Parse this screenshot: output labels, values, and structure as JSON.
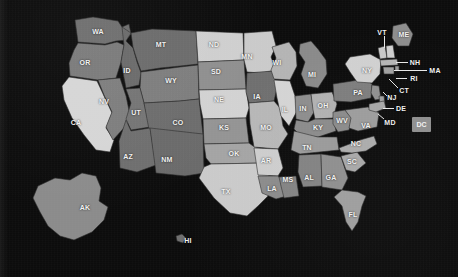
{
  "view": {
    "title": "United States choropleth map",
    "background_color": "#0c0c0c",
    "label_color": "#f2f2f2",
    "leader_line_color": "#e8e8e8",
    "projection": "albers-usa",
    "width": 458,
    "height": 277
  },
  "legend_scale": {
    "type": "sequential-gray",
    "low_color": "#4a4a4a",
    "high_color": "#e2e2e2"
  },
  "states": [
    {
      "code": "WA",
      "name": "Washington",
      "x": 98,
      "y": 31,
      "fill": "#6e6e6e",
      "leader": null
    },
    {
      "code": "OR",
      "name": "Oregon",
      "x": 85,
      "y": 62,
      "fill": "#7a7a7a",
      "leader": null
    },
    {
      "code": "ID",
      "name": "Idaho",
      "x": 127,
      "y": 70,
      "fill": "#6a6a6a",
      "leader": null
    },
    {
      "code": "MT",
      "name": "Montana",
      "x": 161,
      "y": 44,
      "fill": "#6b6b6b",
      "leader": null
    },
    {
      "code": "WY",
      "name": "Wyoming",
      "x": 171,
      "y": 80,
      "fill": "#7d7d7d",
      "leader": null
    },
    {
      "code": "CA",
      "name": "California",
      "x": 76,
      "y": 122,
      "fill": "#d6d6d6",
      "leader": null
    },
    {
      "code": "NV",
      "name": "Nevada",
      "x": 104,
      "y": 101,
      "fill": "#7d7d7d",
      "leader": null
    },
    {
      "code": "UT",
      "name": "Utah",
      "x": 136,
      "y": 112,
      "fill": "#747474",
      "leader": null
    },
    {
      "code": "CO",
      "name": "Colorado",
      "x": 178,
      "y": 122,
      "fill": "#6c6c6c",
      "leader": null
    },
    {
      "code": "AZ",
      "name": "Arizona",
      "x": 128,
      "y": 156,
      "fill": "#6e6e6e",
      "leader": null
    },
    {
      "code": "NM",
      "name": "New Mexico",
      "x": 167,
      "y": 159,
      "fill": "#6a6a6a",
      "leader": null
    },
    {
      "code": "ND",
      "name": "North Dakota",
      "x": 214,
      "y": 44,
      "fill": "#cfcfcf",
      "leader": null
    },
    {
      "code": "SD",
      "name": "South Dakota",
      "x": 216,
      "y": 71,
      "fill": "#8f8f8f",
      "leader": null
    },
    {
      "code": "NE",
      "name": "Nebraska",
      "x": 219,
      "y": 99,
      "fill": "#d2d2d2",
      "leader": null
    },
    {
      "code": "KS",
      "name": "Kansas",
      "x": 224,
      "y": 127,
      "fill": "#949494",
      "leader": null
    },
    {
      "code": "OK",
      "name": "Oklahoma",
      "x": 234,
      "y": 153,
      "fill": "#a4a4a4",
      "leader": null
    },
    {
      "code": "TX",
      "name": "Texas",
      "x": 226,
      "y": 191,
      "fill": "#cacaca",
      "leader": null
    },
    {
      "code": "MN",
      "name": "Minnesota",
      "x": 247,
      "y": 56,
      "fill": "#cacaca",
      "leader": null
    },
    {
      "code": "IA",
      "name": "Iowa",
      "x": 257,
      "y": 96,
      "fill": "#6f6f6f",
      "leader": null
    },
    {
      "code": "MO",
      "name": "Missouri",
      "x": 266,
      "y": 127,
      "fill": "#b7b7b7",
      "leader": null
    },
    {
      "code": "AR",
      "name": "Arkansas",
      "x": 266,
      "y": 160,
      "fill": "#cdcdcd",
      "leader": null
    },
    {
      "code": "LA",
      "name": "Louisiana",
      "x": 272,
      "y": 188,
      "fill": "#8b8b8b",
      "leader": null
    },
    {
      "code": "WI",
      "name": "Wisconsin",
      "x": 277,
      "y": 62,
      "fill": "#b4b4b4",
      "leader": null
    },
    {
      "code": "IL",
      "name": "Illinois",
      "x": 285,
      "y": 109,
      "fill": "#d4d4d4",
      "leader": null
    },
    {
      "code": "MS",
      "name": "Mississippi",
      "x": 288,
      "y": 179,
      "fill": "#838383",
      "leader": null
    },
    {
      "code": "MI",
      "name": "Michigan",
      "x": 312,
      "y": 74,
      "fill": "#8a8a8a",
      "leader": null
    },
    {
      "code": "IN",
      "name": "Indiana",
      "x": 303,
      "y": 108,
      "fill": "#8d8d8d",
      "leader": null
    },
    {
      "code": "OH",
      "name": "Ohio",
      "x": 323,
      "y": 105,
      "fill": "#b1b1b1",
      "leader": null
    },
    {
      "code": "KY",
      "name": "Kentucky",
      "x": 318,
      "y": 127,
      "fill": "#8b8b8b",
      "leader": null
    },
    {
      "code": "TN",
      "name": "Tennessee",
      "x": 307,
      "y": 147,
      "fill": "#9a9a9a",
      "leader": null
    },
    {
      "code": "AL",
      "name": "Alabama",
      "x": 309,
      "y": 177,
      "fill": "#828282",
      "leader": null
    },
    {
      "code": "GA",
      "name": "Georgia",
      "x": 331,
      "y": 177,
      "fill": "#8e8e8e",
      "leader": null
    },
    {
      "code": "FL",
      "name": "Florida",
      "x": 353,
      "y": 214,
      "fill": "#9d9d9d",
      "leader": null
    },
    {
      "code": "SC",
      "name": "SC",
      "x": 352,
      "y": 161,
      "fill": "#a8a8a8",
      "leader": null
    },
    {
      "code": "NC",
      "name": "North Carolina",
      "x": 356,
      "y": 143,
      "fill": "#ababab",
      "leader": null
    },
    {
      "code": "WV",
      "name": "West Virginia",
      "x": 342,
      "y": 120,
      "fill": "#8b8b8b",
      "leader": null
    },
    {
      "code": "VA",
      "name": "Virginia",
      "x": 366,
      "y": 125,
      "fill": "#9c9c9c",
      "leader": null
    },
    {
      "code": "PA",
      "name": "Pennsylvania",
      "x": 358,
      "y": 92,
      "fill": "#7d7d7d",
      "leader": null
    },
    {
      "code": "NY",
      "name": "New York",
      "x": 367,
      "y": 70,
      "fill": "#d0d0d0",
      "leader": null
    },
    {
      "code": "ME",
      "name": "Maine",
      "x": 404,
      "y": 34,
      "fill": "#8d8d8d",
      "leader": null
    },
    {
      "code": "AK",
      "name": "Alaska",
      "x": 85,
      "y": 207,
      "fill": "#8b8b8b",
      "leader": null
    },
    {
      "code": "HI",
      "name": "Hawaii",
      "x": 188,
      "y": 240,
      "fill": "#6f6f6f",
      "leader": null
    },
    {
      "code": "VT",
      "name": "Vermont",
      "x": 382,
      "y": 32,
      "fill": "#c8c8c8",
      "leader": {
        "type": "v",
        "x": 384,
        "y1": 36,
        "y2": 48
      }
    },
    {
      "code": "NH",
      "name": "New Hampshire",
      "x": 415,
      "y": 62,
      "fill": "#cfcfcf",
      "leader": {
        "type": "h",
        "y": 62,
        "x1": 396,
        "x2": 408
      }
    },
    {
      "code": "MA",
      "name": "Massachusetts",
      "x": 435,
      "y": 70,
      "fill": "#b5b5b5",
      "leader": {
        "type": "h",
        "y": 70,
        "x1": 394,
        "x2": 427
      }
    },
    {
      "code": "RI",
      "name": "Rhode Island",
      "x": 414,
      "y": 78,
      "fill": "#9a9a9a",
      "leader": {
        "type": "h",
        "y": 78,
        "x1": 396,
        "x2": 407
      }
    },
    {
      "code": "CT",
      "name": "Connecticut",
      "x": 404,
      "y": 90,
      "fill": "#a0a0a0",
      "leader": {
        "type": "d",
        "x1": 389,
        "y1": 79,
        "x2": 398,
        "y2": 88
      }
    },
    {
      "code": "NJ",
      "name": "New Jersey",
      "x": 392,
      "y": 97,
      "fill": "#909090",
      "leader": {
        "type": "d",
        "x1": 383,
        "y1": 92,
        "x2": 387,
        "y2": 96
      }
    },
    {
      "code": "DE",
      "name": "Delaware",
      "x": 401,
      "y": 108,
      "fill": "#9e9e9e",
      "leader": {
        "type": "h",
        "y": 108,
        "x1": 383,
        "x2": 394
      }
    },
    {
      "code": "MD",
      "name": "Maryland",
      "x": 390,
      "y": 122,
      "fill": "#a6a6a6",
      "leader": {
        "type": "d",
        "x1": 378,
        "y1": 114,
        "x2": 384,
        "y2": 119
      }
    },
    {
      "code": "DC",
      "name": "District of Columbia",
      "x": 422,
      "y": 125,
      "fill": "#8f8f8f",
      "leader": null,
      "box": {
        "x": 412,
        "y": 117,
        "w": 19,
        "h": 15
      }
    }
  ]
}
